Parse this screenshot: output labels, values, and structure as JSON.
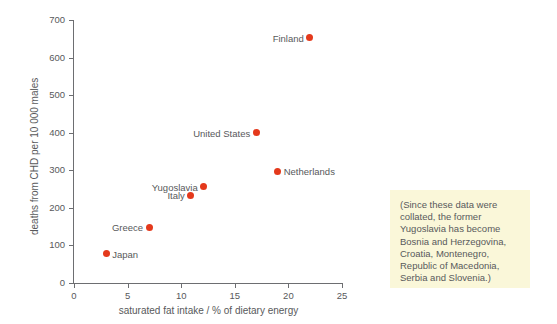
{
  "chart_data": {
    "type": "scatter",
    "title": "",
    "xlabel": "saturated fat intake / % of dietary energy",
    "ylabel": "deaths from CHD per 10 000 males",
    "xlim": [
      0,
      25
    ],
    "ylim": [
      0,
      700
    ],
    "xticks": [
      "0",
      "5",
      "10",
      "15",
      "20",
      "25"
    ],
    "xtick_values": [
      0,
      5,
      10,
      15,
      20,
      25
    ],
    "yticks": [
      "0",
      "100",
      "200",
      "300",
      "400",
      "500",
      "600",
      "700"
    ],
    "ytick_values": [
      0,
      100,
      200,
      300,
      400,
      500,
      600,
      700
    ],
    "grid": false,
    "legend": "none",
    "marker_color": "#e4391c",
    "points": [
      {
        "label": "Japan",
        "x": 3.0,
        "y": 78,
        "label_side": "right"
      },
      {
        "label": "Greece",
        "x": 7.0,
        "y": 148,
        "label_side": "left"
      },
      {
        "label": "Italy",
        "x": 10.9,
        "y": 233,
        "label_side": "left"
      },
      {
        "label": "Yugoslavia",
        "x": 12.1,
        "y": 256,
        "label_side": "left"
      },
      {
        "label": "United States",
        "x": 17.0,
        "y": 400,
        "label_side": "left"
      },
      {
        "label": "Netherlands",
        "x": 19.0,
        "y": 298,
        "label_side": "right"
      },
      {
        "label": "Finland",
        "x": 22.0,
        "y": 653,
        "label_side": "left"
      }
    ]
  },
  "note": {
    "text": "(Since these data were collated, the former Yugoslavia has become Bosnia and Herzegovina, Croatia, Montenegro, Republic of Macedonia, Serbia and Slovenia.)",
    "background_color": "#faf7d9"
  }
}
